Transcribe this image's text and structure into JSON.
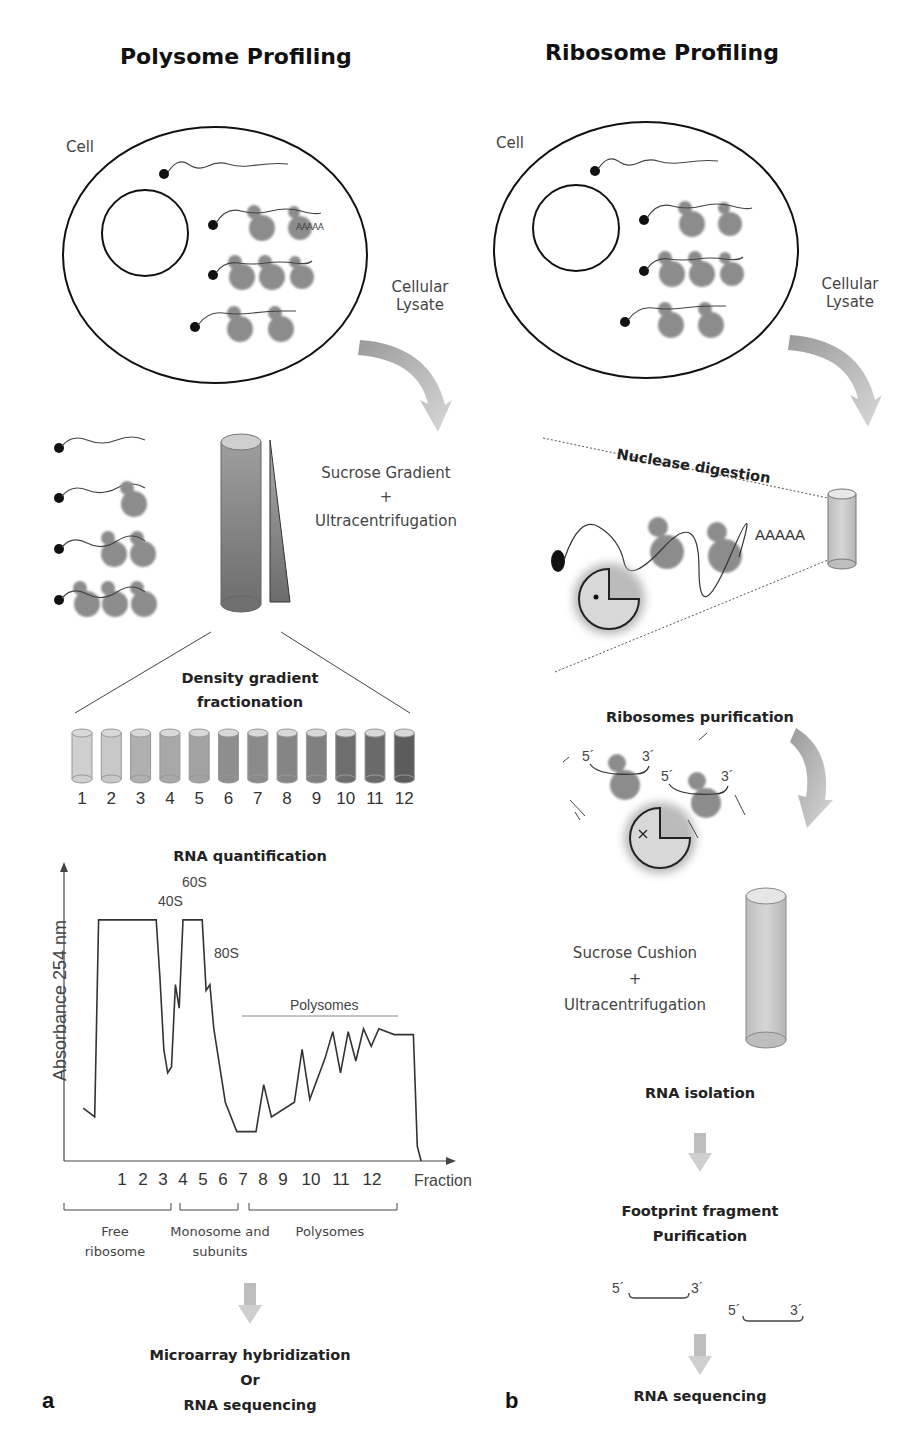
{
  "panel_a": {
    "letter": "a",
    "title": "Polysome Profiling",
    "cell_label": "Cell",
    "lysate_label_line1": "Cellular",
    "lysate_label_line2": "Lysate",
    "gradient_line1": "Sucrose Gradient",
    "gradient_plus": "+",
    "gradient_line2": "Ultracentrifugation",
    "fractionation_line1": "Density gradient",
    "fractionation_line2": "fractionation",
    "fraction_tubes": [
      "1",
      "2",
      "3",
      "4",
      "5",
      "6",
      "7",
      "8",
      "9",
      "10",
      "11",
      "12"
    ],
    "tube_colors": [
      "#cfcfcf",
      "#c8c8c8",
      "#b0b0b0",
      "#a8a8a8",
      "#a2a2a2",
      "#8e8e8e",
      "#8a8a8a",
      "#858585",
      "#808080",
      "#6e6e6e",
      "#6a6a6a",
      "#5c5c5c"
    ],
    "quant_title": "RNA quantification",
    "final_line1": "Microarray hybridization",
    "final_line2": "Or",
    "final_line3": "RNA sequencing",
    "polyA": "AAAAA"
  },
  "panel_b": {
    "letter": "b",
    "title": "Ribosome Profiling",
    "cell_label": "Cell",
    "lysate_label_line1": "Cellular",
    "lysate_label_line2": "Lysate",
    "nuclease_label": "Nuclease digestion",
    "nuclease_polyA": "AAAAA",
    "purification_label": "Ribosomes purification",
    "five_prime": "5´",
    "three_prime": "3´",
    "cushion_line1": "Sucrose Cushion",
    "cushion_plus": "+",
    "cushion_line2": "Ultracentrifugation",
    "rna_isolation": "RNA isolation",
    "footprint_line1": "Footprint fragment",
    "footprint_line2": "Purification",
    "final": "RNA sequencing"
  },
  "chart_data": {
    "type": "line",
    "title": "RNA quantification",
    "xlabel": "Fraction",
    "ylabel": "Absorbance 254 nm",
    "x_ticks": [
      "1",
      "2",
      "3",
      "4",
      "5",
      "6",
      "7",
      "8",
      "9",
      "10",
      "11",
      "12"
    ],
    "peak_labels": [
      "40S",
      "60S",
      "80S",
      "Polysomes"
    ],
    "groups": [
      {
        "label_line1": "Free",
        "label_line2": "ribosome",
        "fractions": "1-3"
      },
      {
        "label_line1": "Monosome and",
        "label_line2": "subunits",
        "fractions": "4-7"
      },
      {
        "label_line1": "Polysomes",
        "label_line2": "",
        "fractions": "7-12"
      }
    ],
    "profile_points_relative": [
      [
        0.05,
        0.18
      ],
      [
        0.08,
        0.15
      ],
      [
        0.09,
        0.82
      ],
      [
        0.24,
        0.82
      ],
      [
        0.25,
        0.62
      ],
      [
        0.26,
        0.38
      ],
      [
        0.27,
        0.3
      ],
      [
        0.28,
        0.32
      ],
      [
        0.29,
        0.6
      ],
      [
        0.3,
        0.52
      ],
      [
        0.31,
        0.82
      ],
      [
        0.36,
        0.82
      ],
      [
        0.37,
        0.58
      ],
      [
        0.38,
        0.6
      ],
      [
        0.39,
        0.45
      ],
      [
        0.42,
        0.2
      ],
      [
        0.45,
        0.1
      ],
      [
        0.5,
        0.1
      ],
      [
        0.52,
        0.26
      ],
      [
        0.54,
        0.15
      ],
      [
        0.6,
        0.2
      ],
      [
        0.62,
        0.38
      ],
      [
        0.64,
        0.21
      ],
      [
        0.68,
        0.35
      ],
      [
        0.7,
        0.44
      ],
      [
        0.72,
        0.3
      ],
      [
        0.74,
        0.44
      ],
      [
        0.76,
        0.34
      ],
      [
        0.78,
        0.45
      ],
      [
        0.8,
        0.39
      ],
      [
        0.82,
        0.45
      ],
      [
        0.86,
        0.43
      ],
      [
        0.91,
        0.43
      ],
      [
        0.92,
        0.05
      ],
      [
        0.93,
        0.0
      ]
    ],
    "grid": false
  }
}
